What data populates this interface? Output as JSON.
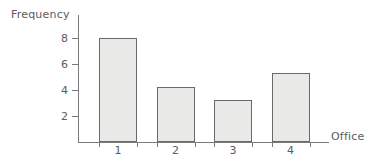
{
  "chart_data": {
    "type": "bar",
    "title": "",
    "xlabel": "Office",
    "ylabel": "Frequency",
    "categories": [
      "1",
      "2",
      "3",
      "4"
    ],
    "values": [
      8,
      4.2,
      3.2,
      5.3
    ],
    "ytick_labels": [
      "8",
      "6",
      "4",
      "2"
    ],
    "ytick_values": [
      8,
      6,
      4,
      2
    ],
    "ylim": [
      0,
      9.8
    ],
    "grid": false,
    "legend": null,
    "colors": {
      "bar_fill": "#e9e9e7",
      "bar_border": "#6a6a6a",
      "axis": "#7a7a7a",
      "text": "#5c5c5c",
      "background": "#ffffff"
    }
  }
}
